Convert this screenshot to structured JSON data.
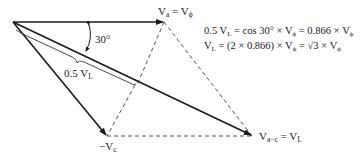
{
  "diagram": {
    "type": "phasor-diagram",
    "colors": {
      "vector": "#1a1a1a",
      "dashed": "#555555",
      "brace": "#333333"
    },
    "vectors": [
      {
        "id": "Va",
        "from": [
          13,
          22
        ],
        "to": [
          164,
          22
        ],
        "style": "solid-arrow"
      },
      {
        "id": "minusVc",
        "from": [
          13,
          22
        ],
        "to": [
          107,
          136
        ],
        "style": "solid-arrow"
      },
      {
        "id": "Vac",
        "from": [
          13,
          22
        ],
        "to": [
          252,
          136
        ],
        "style": "solid-arrow"
      }
    ],
    "dashed_lines": [
      {
        "from": [
          164,
          22
        ],
        "to": [
          252,
          136
        ]
      },
      {
        "from": [
          107,
          136
        ],
        "to": [
          252,
          136
        ]
      },
      {
        "from": [
          164,
          22
        ],
        "to": [
          137,
          85
        ]
      }
    ],
    "labels": {
      "va_main": "V",
      "va_sub": "a",
      "va_eq": " = V",
      "va_eq_sub": "ϕ",
      "angle": "30°",
      "half_vl_main": "0.5 V",
      "half_vl_sub": "L",
      "minus_vc_main": "−V",
      "minus_vc_sub": "c",
      "vac_main": "V",
      "vac_sub": "a−c",
      "vac_eq": " = V",
      "vac_eq_sub": "L"
    },
    "equations": {
      "line1": {
        "p1": "0.5 V",
        "p1_sub": "L",
        "p2": " = cos 30° × V",
        "p2_sub": "ϕ",
        "p3": " = 0.866 × V",
        "p3_sub": "ϕ"
      },
      "line2": {
        "p1": "V",
        "p1_sub": "L",
        "p2": " = (2 × 0.866) × V",
        "p2_sub": "ϕ",
        "p3": " = √3 × V",
        "p3_sub": "ϕ"
      }
    }
  }
}
